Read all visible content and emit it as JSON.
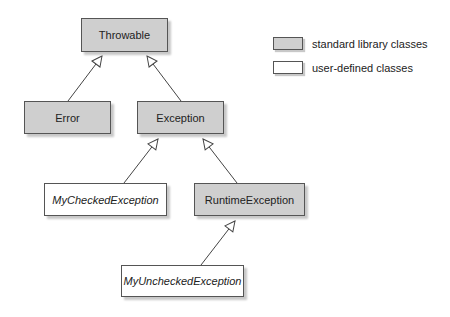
{
  "diagram": {
    "type": "uml-class-hierarchy",
    "classes": [
      {
        "id": "throwable",
        "label": "Throwable",
        "kind": "standard"
      },
      {
        "id": "error",
        "label": "Error",
        "kind": "standard"
      },
      {
        "id": "exception",
        "label": "Exception",
        "kind": "standard"
      },
      {
        "id": "mychecked",
        "label": "MyCheckedException",
        "kind": "user"
      },
      {
        "id": "runtime",
        "label": "RuntimeException",
        "kind": "standard"
      },
      {
        "id": "myunchecked",
        "label": "MyUncheckedException",
        "kind": "user"
      }
    ],
    "inheritance": [
      {
        "child": "Error",
        "parent": "Throwable"
      },
      {
        "child": "Exception",
        "parent": "Throwable"
      },
      {
        "child": "MyCheckedException",
        "parent": "Exception"
      },
      {
        "child": "RuntimeException",
        "parent": "Exception"
      },
      {
        "child": "MyUncheckedException",
        "parent": "RuntimeException"
      }
    ]
  },
  "legend": {
    "standard": "standard library classes",
    "user": "user-defined classes"
  },
  "colors": {
    "standard_fill": "#cfcfcf",
    "user_fill": "#ffffff",
    "border": "#555555"
  }
}
